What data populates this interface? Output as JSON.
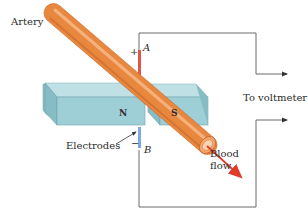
{
  "diagram": {
    "labels": {
      "artery": "Artery",
      "electrodes": "Electrodes",
      "blood_flow_line1": "Blood",
      "blood_flow_line2": "flow",
      "to_voltmeter": "To voltmeter",
      "north_pole": "N",
      "south_pole": "S",
      "electrode_a": "A",
      "electrode_b": "B",
      "plus_sign": "+",
      "minus_sign": "−"
    },
    "colors": {
      "artery_fill": "#e8883f",
      "artery_highlight": "#f4b07a",
      "artery_dark": "#c9652a",
      "magnet_front": "#9fcfd6",
      "magnet_top": "#bfe0e4",
      "magnet_side": "#86bcc4",
      "electrode_positive": "#e0574a",
      "electrode_negative": "#7aa9e6",
      "flow_arrow": "#e03a2a",
      "wire": "#6b6b6b"
    }
  }
}
